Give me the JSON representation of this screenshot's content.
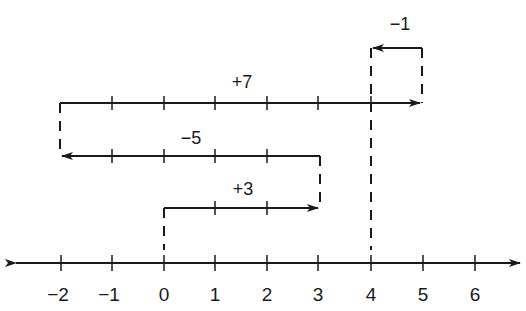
{
  "diagram": {
    "type": "number-line-addition",
    "expression": "+3 -5 +7 -1",
    "axis": {
      "tick_labels": [
        "−2",
        "−1",
        "0",
        "1",
        "2",
        "3",
        "4",
        "5",
        "6"
      ],
      "tick_values": [
        -2,
        -1,
        0,
        1,
        2,
        3,
        4,
        5,
        6
      ],
      "arrows_both_ends": true
    },
    "steps": [
      {
        "label": "+3",
        "from": 0,
        "to": 3,
        "direction": "right"
      },
      {
        "label": "−5",
        "from": 3,
        "to": -2,
        "direction": "left"
      },
      {
        "label": "+7",
        "from": -2,
        "to": 5,
        "direction": "right"
      },
      {
        "label": "−1",
        "from": 5,
        "to": 4,
        "direction": "left"
      }
    ],
    "start_value": 0,
    "result_value": 4,
    "colors": {
      "ink": "#1a1a1a",
      "background": "#ffffff"
    }
  }
}
